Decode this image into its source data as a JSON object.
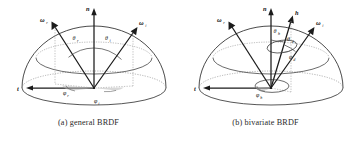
{
  "figure": {
    "title": "",
    "background_color": "#ffffff",
    "line_color": "#1b1b1b",
    "dashed_color": "#9a9a9a"
  },
  "panels": [
    {
      "id": "a",
      "caption": "(a) general BRDF",
      "description": "Hemisphere with surface normal n, tangent t, incoming direction omega_i and outgoing direction omega_r with their polar and azimuthal angles.",
      "labels": {
        "normal": "n",
        "tangent": "t",
        "omega_r": "ω",
        "omega_r_sub": "r",
        "omega_i": "ω",
        "omega_i_sub": "i",
        "theta_r": "θ",
        "theta_r_sub": "r",
        "theta_i": "θ",
        "theta_i_sub": "i",
        "phi_r": "φ",
        "phi_r_sub": "r",
        "phi_i": "φ",
        "phi_i_sub": "i"
      }
    },
    {
      "id": "b",
      "caption": "(b) bivariate BRDF",
      "description": "Hemisphere with surface normal n, tangent t, half vector h, omega_i and omega_r, showing half-angle parameterization theta_h, phi_h, theta_d, phi_d.",
      "labels": {
        "normal": "n",
        "tangent": "t",
        "half_vector": "h",
        "omega_r": "ω",
        "omega_r_sub": "r",
        "omega_i": "ω",
        "omega_i_sub": "i",
        "theta_h": "θ",
        "theta_h_sub": "h",
        "theta_d": "θ",
        "theta_d_sub": "d",
        "phi_d": "φ",
        "phi_d_sub": "d",
        "phi_h": "φ",
        "phi_h_sub": "h"
      }
    }
  ]
}
